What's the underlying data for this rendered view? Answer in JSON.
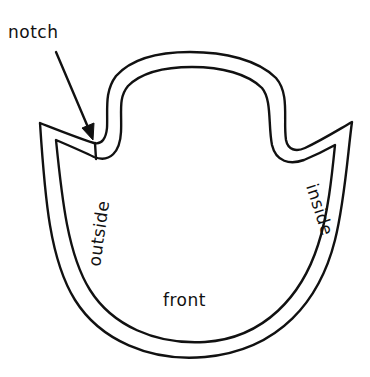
{
  "diagram": {
    "type": "sewing-pattern-piece",
    "labels": {
      "notch": "notch",
      "outside": "outside",
      "inside": "inside",
      "front": "front"
    },
    "colors": {
      "line": "#111111",
      "background": "#ffffff"
    }
  }
}
